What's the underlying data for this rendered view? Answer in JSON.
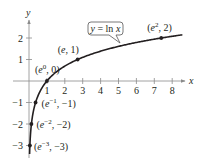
{
  "chart_data": {
    "type": "line",
    "title": "",
    "xlabel": "x",
    "ylabel": "y",
    "xlim": [
      0,
      8.6
    ],
    "ylim": [
      -3.4,
      2.6
    ],
    "x_ticks": [
      1,
      2,
      3,
      4,
      5,
      6,
      7,
      8
    ],
    "y_ticks": [
      -3,
      -2,
      -1,
      1,
      2
    ],
    "grid": false,
    "legend": null,
    "series": [
      {
        "name": "y = ln x",
        "function": "ln(x)",
        "color": "#231f20"
      }
    ],
    "points": [
      {
        "label_base": "(e",
        "sup": "-3",
        "label_rest": ", -3)",
        "x": 0.0498,
        "y": -3
      },
      {
        "label_base": "(e",
        "sup": "-2",
        "label_rest": ", -2)",
        "x": 0.1353,
        "y": -2
      },
      {
        "label_base": "(e",
        "sup": "-1",
        "label_rest": ", -1)",
        "x": 0.3679,
        "y": -1
      },
      {
        "label_base": "(e",
        "sup": "0",
        "label_rest": ", 0)",
        "x": 1,
        "y": 0
      },
      {
        "label_base": "(e, 1)",
        "sup": "",
        "label_rest": "",
        "x": 2.7183,
        "y": 1
      },
      {
        "label_base": "(e",
        "sup": "2",
        "label_rest": ", 2)",
        "x": 7.389,
        "y": 2
      }
    ],
    "annotations": [
      {
        "text": "y = ln x",
        "type": "callout"
      }
    ]
  },
  "axes": {
    "x_label": "x",
    "y_label": "y",
    "x_tick_labels": [
      "1",
      "2",
      "3",
      "4",
      "5",
      "6",
      "7",
      "8"
    ],
    "y_tick_labels": [
      "2",
      "1",
      "-1",
      "-2",
      "-3"
    ]
  },
  "callout": {
    "label_y": "y",
    "label_eq": " = ln ",
    "label_x": "x"
  },
  "colors": {
    "ink": "#231f20",
    "axis": "#8a8a8a",
    "background": "#ffffff"
  }
}
